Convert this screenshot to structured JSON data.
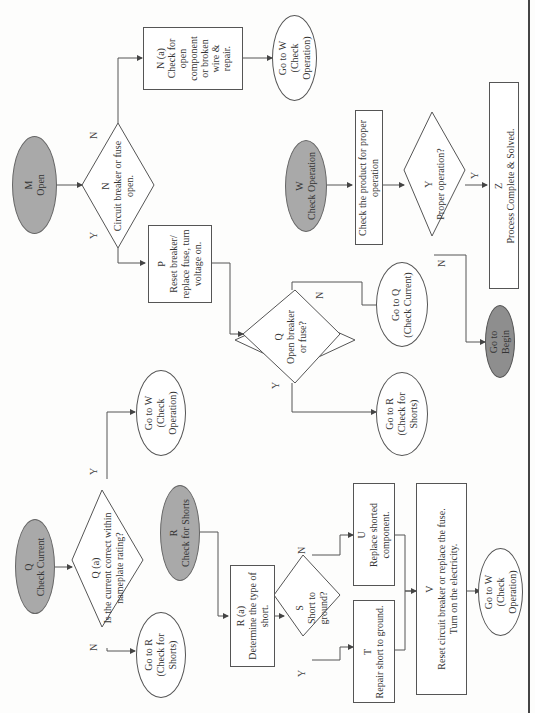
{
  "diagram": {
    "orientation": "rotated-90-ccw",
    "colors": {
      "start_fill": "#a9a9a9",
      "begin_fill": "#8e8e8e",
      "line": "#555555",
      "background": "#fdfdfc"
    },
    "nodes": {
      "m_open": {
        "type": "terminator-filled",
        "line1": "M",
        "line2": "Open"
      },
      "n_decision": {
        "type": "decision",
        "line1": "N",
        "line2": "Circuit breaker or fuse",
        "line3": "open."
      },
      "n_a_box": {
        "type": "process",
        "line1": "N (a)",
        "line2": "Check for",
        "line3": "open",
        "line4": "component",
        "line5": "or broken",
        "line6": "wire &",
        "line7": "repair."
      },
      "goto_w_top": {
        "type": "connector",
        "line1": "Go to W",
        "line2": "(Check",
        "line3": "Operation)"
      },
      "p_box": {
        "type": "process",
        "line1": "P",
        "line2": "Reset breaker/",
        "line3": "replace fuse, turn",
        "line4": "voltage on."
      },
      "q_decision_open": {
        "type": "decision",
        "line1": "Q",
        "line2": "Open breaker",
        "line3": "or fuse?"
      },
      "goto_q": {
        "type": "connector",
        "line1": "Go to Q",
        "line2": "(Check Current)"
      },
      "goto_r_mid": {
        "type": "connector",
        "line1": "Go to R",
        "line2": "(Check for",
        "line3": "Shorts)"
      },
      "w_check_operation": {
        "type": "terminator-filled",
        "line1": "W",
        "line2": "Check Operation"
      },
      "w_box": {
        "type": "process",
        "line1": "Check the product for proper",
        "line2": "operation"
      },
      "y_decision": {
        "type": "decision",
        "line1": "Y",
        "line2": "Proper operation?"
      },
      "z_box": {
        "type": "process",
        "line1": "Z",
        "line2": "Process Complete & Solved."
      },
      "goto_begin": {
        "type": "terminator-dark",
        "line1": "Go to",
        "line2": "Begin"
      },
      "q_check_current": {
        "type": "terminator-filled",
        "line1": "Q",
        "line2": "Check Current"
      },
      "q_a_decision": {
        "type": "decision",
        "line1": "Q (a)",
        "line2": "Is the current correct within",
        "line3": "nameplate rating?"
      },
      "goto_w_mid": {
        "type": "connector",
        "line1": "Go to W",
        "line2": "(Check",
        "line3": "Operation)"
      },
      "goto_r_left": {
        "type": "connector",
        "line1": "Go to R",
        "line2": "(Check for",
        "line3": "Shorts)"
      },
      "r_check_shorts": {
        "type": "terminator-filled",
        "line1": "R",
        "line2": "Check for Shorts"
      },
      "r_a_box": {
        "type": "process",
        "line1": "R (a)",
        "line2": "Determine the type of",
        "line3": "short."
      },
      "s_decision": {
        "type": "decision",
        "line1": "S",
        "line2": "Short to",
        "line3": "ground?"
      },
      "t_box": {
        "type": "process",
        "line1": "T",
        "line2": "Repair short to ground."
      },
      "u_box": {
        "type": "process",
        "line1": "U",
        "line2": "Replace shorted",
        "line3": "component."
      },
      "v_box": {
        "type": "process",
        "line1": "V",
        "line2": "Reset circuit breaker or replace the fuse.",
        "line3": "Turn on the electricity."
      },
      "goto_w_bottom": {
        "type": "connector",
        "line1": "Go to W",
        "line2": "(Check",
        "line3": "Operation)"
      }
    },
    "edge_labels": {
      "n_yes": "Y",
      "n_no": "N",
      "q_open_yes": "Y",
      "q_open_no": "N",
      "y_yes": "Y",
      "y_no": "N",
      "qa_yes": "Y",
      "qa_no": "N",
      "s_yes": "Y",
      "s_no": "N"
    }
  }
}
